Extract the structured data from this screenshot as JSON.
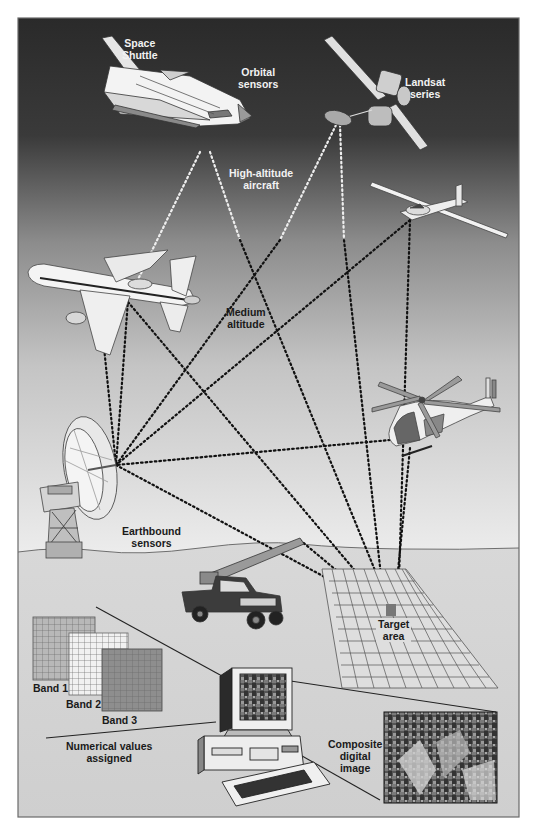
{
  "figure": {
    "type": "remote-sensing-platforms-illustration",
    "colors": {
      "sky_top": "#2b2b2b",
      "sky_mid": "#8a8a8a",
      "sky_bottom": "#e8e8e8",
      "ground": "#d4d4d4",
      "frame_border": "#6a6a6a",
      "dotted_line": "#111111",
      "sensor_lines_on_dark": "#f0f0f0"
    },
    "platforms": [
      {
        "id": "space-shuttle",
        "label": "Space Shuttle",
        "tier": "orbital"
      },
      {
        "id": "landsat",
        "label": "Landsat series",
        "tier": "orbital"
      },
      {
        "id": "glider",
        "label": "",
        "tier": "high-altitude"
      },
      {
        "id": "airliner",
        "label": "",
        "tier": "high-altitude"
      },
      {
        "id": "helicopter",
        "label": "",
        "tier": "medium-altitude"
      },
      {
        "id": "radio-dish",
        "label": "",
        "tier": "earthbound"
      },
      {
        "id": "truck-boom",
        "label": "",
        "tier": "earthbound"
      }
    ]
  },
  "labels": {
    "space_shuttle_line1": "Space",
    "space_shuttle_line2": "Shuttle",
    "orbital_line1": "Orbital",
    "orbital_line2": "sensors",
    "landsat_line1": "Landsat",
    "landsat_line2": "series",
    "high_alt_line1": "High-altitude",
    "high_alt_line2": "aircraft",
    "medium_line1": "Medium",
    "medium_line2": "altitude",
    "earthbound_line1": "Earthbound",
    "earthbound_line2": "sensors",
    "target_line1": "Target",
    "target_line2": "area",
    "band1": "Band 1",
    "band2": "Band 2",
    "band3": "Band 3",
    "numerical_line1": "Numerical values",
    "numerical_line2": "assigned",
    "composite_line1": "Composite",
    "composite_line2": "digital",
    "composite_line3": "image"
  }
}
